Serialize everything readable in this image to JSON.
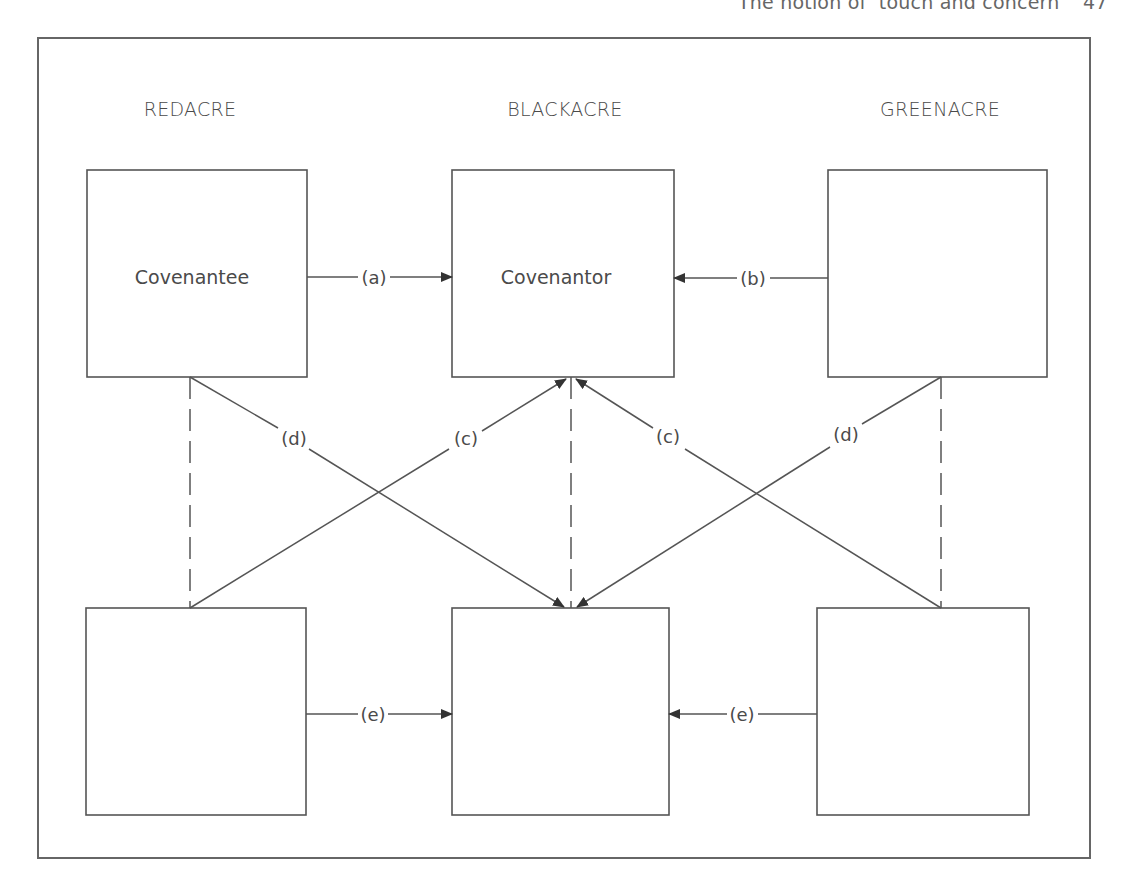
{
  "running_head": {
    "title": "The notion of ‘touch and concern’",
    "page": "47"
  },
  "diagram": {
    "regions": [
      {
        "id": "redacre",
        "label": "REDACRE"
      },
      {
        "id": "blackacre",
        "label": "BLACKACRE"
      },
      {
        "id": "greenacre",
        "label": "GREENACRE"
      }
    ],
    "boxes": {
      "top_left": {
        "label": "Covenantee"
      },
      "top_center": {
        "label": "Covenantor"
      },
      "top_right": {
        "label": ""
      },
      "bottom_left": {
        "label": ""
      },
      "bottom_center": {
        "label": ""
      },
      "bottom_right": {
        "label": ""
      }
    },
    "edges": {
      "a": "(a)",
      "b": "(b)",
      "c_left": "(c)",
      "c_right": "(c)",
      "d_left": "(d)",
      "d_right": "(d)",
      "e_left": "(e)",
      "e_right": "(e)"
    },
    "colors": {
      "stroke": "#555555",
      "text": "#4a4a4a"
    }
  }
}
